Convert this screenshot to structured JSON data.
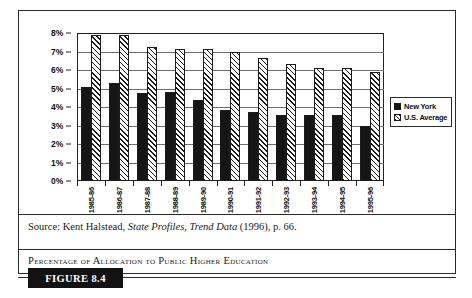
{
  "figure": {
    "tag_label": "FIGURE 8.4",
    "caption": "Percentage of Allocation to Public Higher Education",
    "source_prefix": "Source: Kent Halstead, ",
    "source_italic_1": "State Profiles",
    "source_mid": ", ",
    "source_italic_2": "Trend Data",
    "source_suffix": " (1996), p. 66."
  },
  "colors": {
    "new_york_fill": "#151515",
    "us_average_fill": "#ffffff",
    "hatch_stroke": "#1a1a1a",
    "axis": "#222222",
    "gridline": "#6e6e6e",
    "frame": "#2b2b2b",
    "tag_background": "#121212",
    "tag_text": "#ffffff"
  },
  "legend": {
    "position": "right-middle",
    "entries": [
      {
        "label": "New York",
        "swatch": "solid-black-square"
      },
      {
        "label": "U.S. Average",
        "swatch": "hatched-square"
      }
    ]
  },
  "chart_data": {
    "type": "bar",
    "title": "Percentage of Allocation to Public Higher Education",
    "xlabel": "",
    "ylabel": "",
    "ylim": [
      0,
      8
    ],
    "ytick_labels": [
      "8%",
      "7%",
      "6%",
      "5%",
      "4%",
      "3%",
      "2%",
      "1%",
      "0%"
    ],
    "ytick_values": [
      8,
      7,
      6,
      5,
      4,
      3,
      2,
      1,
      0
    ],
    "grid": true,
    "grid_axis": "y",
    "value_unit": "percent",
    "categories": [
      "1985-86",
      "1986-87",
      "1987-88",
      "1988-89",
      "1989-90",
      "1990-91",
      "1991-92",
      "1992-93",
      "1993-94",
      "1994-95",
      "1995-96"
    ],
    "series": [
      {
        "name": "New York",
        "values": [
          5.1,
          5.3,
          4.75,
          4.8,
          4.4,
          3.85,
          3.75,
          3.55,
          3.55,
          3.55,
          3.0
        ]
      },
      {
        "name": "U.S. Average",
        "values": [
          7.9,
          7.9,
          7.25,
          7.15,
          7.15,
          6.95,
          6.65,
          6.3,
          6.1,
          6.1,
          5.9
        ]
      }
    ]
  }
}
